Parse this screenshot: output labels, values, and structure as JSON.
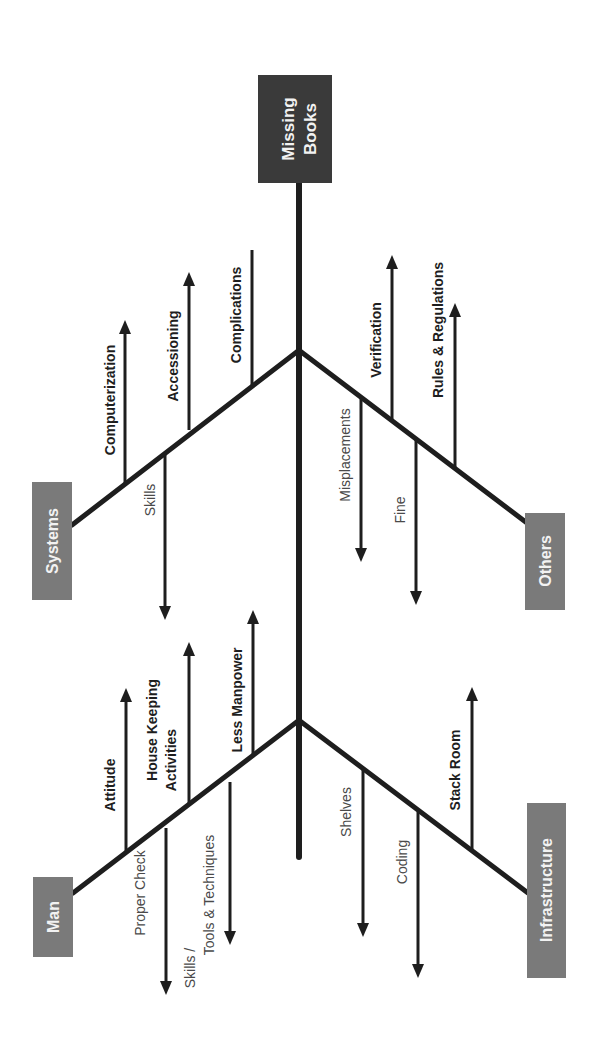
{
  "diagram": {
    "type": "fishbone",
    "orientation": "rotated-90-ccw",
    "effect": {
      "label": "Missing Books",
      "line1": "Missing",
      "line2": "Books",
      "color": "#3a3a3a"
    },
    "category_color": "#7a7a7a",
    "categories": [
      {
        "label": "Systems",
        "causes": [
          {
            "label": "Computerization",
            "side": "up"
          },
          {
            "label": "Accessioning",
            "side": "up"
          },
          {
            "label": "Complications",
            "side": "up"
          },
          {
            "label": "Skills",
            "side": "down"
          }
        ]
      },
      {
        "label": "Others",
        "causes": [
          {
            "label": "Verification",
            "side": "up"
          },
          {
            "label": "Rules & Regulations",
            "side": "up"
          },
          {
            "label": "Misplacements",
            "side": "down"
          },
          {
            "label": "Fine",
            "side": "down"
          }
        ]
      },
      {
        "label": "Man",
        "causes": [
          {
            "label": "Attitude",
            "side": "up"
          },
          {
            "label": "House Keeping Activities",
            "line1": "House Keeping",
            "line2": "Activities",
            "side": "up"
          },
          {
            "label": "Less Manpower",
            "side": "up"
          },
          {
            "label": "Proper Check",
            "side": "down"
          },
          {
            "label": "Skills / Tools & Techniques",
            "line1": "Skills /",
            "line2": "Tools & Techniques",
            "side": "down"
          }
        ]
      },
      {
        "label": "Infrastructure",
        "causes": [
          {
            "label": "Stack Room",
            "side": "up"
          },
          {
            "label": "Shelves",
            "side": "down"
          },
          {
            "label": "Coding",
            "side": "down"
          }
        ]
      }
    ]
  }
}
